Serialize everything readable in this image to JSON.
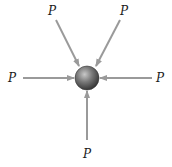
{
  "diagram": {
    "particle": {
      "cx": 87,
      "cy": 78,
      "r": 12
    },
    "arrow_color": "#9a9a9a",
    "forces": [
      {
        "id": "upper-left",
        "label": "P",
        "from": [
          56,
          20
        ],
        "to": [
          79,
          66
        ],
        "label_pos": [
          52,
          15
        ]
      },
      {
        "id": "upper-right",
        "label": "P",
        "from": [
          120,
          20
        ],
        "to": [
          96,
          66
        ],
        "label_pos": [
          124,
          15
        ]
      },
      {
        "id": "left",
        "label": "P",
        "from": [
          23,
          78
        ],
        "to": [
          74,
          78
        ],
        "label_pos": [
          12,
          82
        ]
      },
      {
        "id": "right",
        "label": "P",
        "from": [
          152,
          78
        ],
        "to": [
          100,
          78
        ],
        "label_pos": [
          160,
          82
        ]
      },
      {
        "id": "bottom",
        "label": "P",
        "from": [
          87,
          140
        ],
        "to": [
          87,
          91
        ],
        "label_pos": [
          87,
          158
        ]
      }
    ]
  }
}
